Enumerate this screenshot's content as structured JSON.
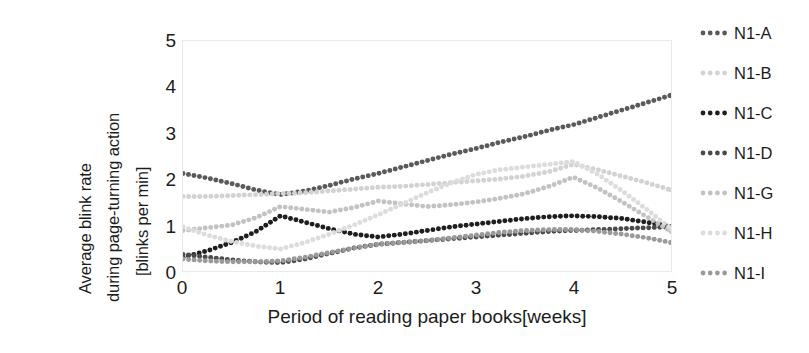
{
  "chart_data": {
    "type": "line",
    "title": "",
    "xlabel": "Period of reading paper books[weeks]",
    "ylabel": "Average blink rate during page-turning action [blinks per min]",
    "ylabel_lines": [
      "Average blink rate",
      "during page-turning action",
      "[blinks per min]"
    ],
    "xlim": [
      0,
      5
    ],
    "ylim": [
      0,
      5
    ],
    "xticks": [
      0,
      1,
      2,
      3,
      4,
      5
    ],
    "yticks": [
      0,
      1,
      2,
      3,
      4,
      5
    ],
    "xtick_labels": [
      "0",
      "1",
      "2",
      "3",
      "4",
      "5"
    ],
    "ytick_labels": [
      "0",
      "1",
      "2",
      "3",
      "4",
      "5"
    ],
    "grid": false,
    "line_style": "dotted",
    "marker": "round-dot",
    "legend_position": "right",
    "x": [
      0,
      0.25,
      0.5,
      0.75,
      1,
      1.25,
      1.5,
      1.75,
      2,
      2.25,
      2.5,
      2.75,
      3,
      3.25,
      3.5,
      3.75,
      4,
      4.25,
      4.5,
      4.75,
      5
    ],
    "series": [
      {
        "name": "N1-A",
        "color": "#5a5a5a",
        "values": [
          2.12,
          2.02,
          1.9,
          1.76,
          1.66,
          1.74,
          1.86,
          2.0,
          2.12,
          2.26,
          2.4,
          2.54,
          2.66,
          2.8,
          2.92,
          3.06,
          3.18,
          3.34,
          3.5,
          3.66,
          3.82
        ]
      },
      {
        "name": "N1-B",
        "color": "#d2d2d2",
        "values": [
          1.62,
          1.62,
          1.64,
          1.66,
          1.68,
          1.7,
          1.74,
          1.78,
          1.82,
          1.84,
          1.88,
          1.92,
          1.96,
          2.0,
          2.06,
          2.16,
          2.32,
          2.2,
          2.06,
          1.92,
          1.76
        ]
      },
      {
        "name": "N1-C",
        "color": "#1e1e1e",
        "values": [
          0.3,
          0.44,
          0.62,
          0.86,
          1.2,
          1.06,
          0.92,
          0.8,
          0.74,
          0.8,
          0.88,
          0.96,
          1.02,
          1.08,
          1.14,
          1.18,
          1.2,
          1.18,
          1.14,
          1.06,
          0.96
        ]
      },
      {
        "name": "N1-D",
        "color": "#4a4a4a",
        "values": [
          0.36,
          0.3,
          0.24,
          0.2,
          0.18,
          0.26,
          0.38,
          0.5,
          0.58,
          0.62,
          0.66,
          0.7,
          0.74,
          0.78,
          0.82,
          0.86,
          0.88,
          0.9,
          0.92,
          0.94,
          0.96
        ]
      },
      {
        "name": "N1-G",
        "color": "#c2c2c2",
        "values": [
          0.88,
          0.94,
          1.0,
          1.16,
          1.4,
          1.34,
          1.28,
          1.38,
          1.52,
          1.46,
          1.4,
          1.44,
          1.5,
          1.58,
          1.68,
          1.84,
          2.04,
          1.8,
          1.5,
          1.18,
          0.86
        ]
      },
      {
        "name": "N1-H",
        "color": "#dcdcdc",
        "values": [
          0.96,
          0.78,
          0.64,
          0.54,
          0.48,
          0.62,
          0.8,
          1.0,
          1.22,
          1.46,
          1.7,
          1.92,
          2.1,
          2.2,
          2.26,
          2.32,
          2.38,
          2.1,
          1.74,
          1.34,
          0.92
        ]
      },
      {
        "name": "N1-I",
        "color": "#9a9a9a",
        "values": [
          0.26,
          0.22,
          0.2,
          0.2,
          0.22,
          0.3,
          0.4,
          0.5,
          0.58,
          0.62,
          0.66,
          0.72,
          0.78,
          0.84,
          0.88,
          0.9,
          0.9,
          0.86,
          0.8,
          0.72,
          0.62
        ]
      }
    ]
  },
  "legend": {
    "items": [
      {
        "label": "N1-A",
        "color": "#5a5a5a"
      },
      {
        "label": "N1-B",
        "color": "#d2d2d2"
      },
      {
        "label": "N1-C",
        "color": "#1e1e1e"
      },
      {
        "label": "N1-D",
        "color": "#4a4a4a"
      },
      {
        "label": "N1-G",
        "color": "#c2c2c2"
      },
      {
        "label": "N1-H",
        "color": "#dcdcdc"
      },
      {
        "label": "N1-I",
        "color": "#9a9a9a"
      }
    ]
  },
  "axes": {
    "frame_color": "#e9e9e9",
    "text_color": "#1c1c1c"
  }
}
